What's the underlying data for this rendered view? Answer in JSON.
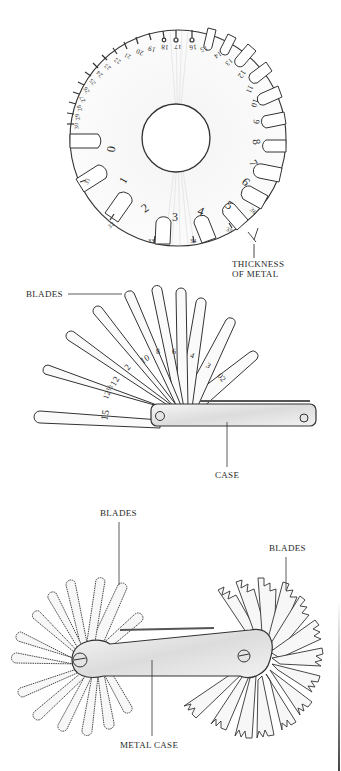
{
  "figure_1": {
    "name": "wire-gauge",
    "label_thickness": "THICKNESS",
    "label_of_metal": "OF METAL",
    "large_numbers": [
      "0",
      "1",
      "2",
      "3",
      "4",
      "5",
      "6",
      "7",
      "8",
      "9",
      "10",
      "11",
      "12",
      "13",
      "14",
      "15",
      "16",
      "17",
      "18",
      "19",
      "20"
    ],
    "small_numbers_upper": [
      "21",
      "22",
      "23",
      "24",
      "25",
      "26",
      "27",
      "28",
      "29",
      "30",
      "31",
      "32"
    ],
    "small_numbers_lower": [
      "33",
      "34",
      "35",
      "36"
    ]
  },
  "figure_2": {
    "name": "feeler-gauge",
    "label_blades": "BLADES",
    "label_case": "CASE",
    "blade_numbers": [
      "15",
      "12½",
      "12",
      "2",
      "10",
      "8",
      "6",
      "4",
      "3",
      "02"
    ]
  },
  "figure_3": {
    "name": "screw-pitch-gauge",
    "label_blades_left": "BLADES",
    "label_blades_right": "BLADES",
    "label_metal_case": "METAL CASE"
  },
  "colors": {
    "ink": "#2a2a2a",
    "metal_shade": "#c8c8c8",
    "background": "#ffffff"
  }
}
